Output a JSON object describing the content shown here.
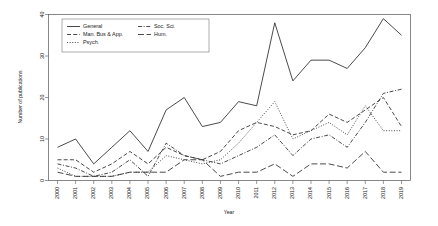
{
  "chart_data": {
    "type": "line",
    "title": "",
    "xlabel": "Year",
    "ylabel": "Number of publications",
    "x": [
      2000,
      2001,
      2002,
      2003,
      2004,
      2005,
      2006,
      2007,
      2008,
      2009,
      2010,
      2011,
      2012,
      2013,
      2014,
      2015,
      2016,
      2017,
      2018,
      2019
    ],
    "xtick_labels": [
      "2000",
      "2001",
      "2002",
      "2003",
      "2004",
      "2005",
      "2006",
      "2007",
      "2008",
      "2009",
      "2010",
      "2011",
      "2012",
      "2013",
      "2014",
      "2015",
      "2016",
      "2017",
      "2018",
      "2019"
    ],
    "ytick_labels": [
      "0",
      "10",
      "20",
      "30",
      "40"
    ],
    "yticks": [
      0,
      10,
      20,
      30,
      40
    ],
    "ylim": [
      0,
      40
    ],
    "xlim": [
      2000,
      2019
    ],
    "grid": false,
    "legend_position": "top-left-inside",
    "series": [
      {
        "name": "General",
        "dash": "solid",
        "values": [
          8,
          10,
          4,
          8,
          12,
          7,
          17,
          20,
          13,
          14,
          19,
          18,
          38,
          24,
          29,
          29,
          27,
          32,
          39,
          35
        ]
      },
      {
        "name": "Man. Bus & App.",
        "dash": "dashed",
        "values": [
          5,
          5,
          2,
          4,
          7,
          4,
          8,
          6,
          5,
          7,
          12,
          14,
          13,
          11,
          12,
          16,
          14,
          17,
          20,
          13
        ]
      },
      {
        "name": "Psych.",
        "dash": "dotted",
        "values": [
          3,
          1,
          1,
          1,
          2,
          2,
          6,
          5,
          4,
          5,
          9,
          14,
          19,
          10,
          12,
          14,
          11,
          18,
          12,
          12
        ]
      },
      {
        "name": "Soc. Sci.",
        "dash": "dashdot",
        "values": [
          4,
          3,
          1,
          2,
          5,
          1,
          9,
          6,
          5,
          4,
          6,
          8,
          11,
          6,
          10,
          11,
          8,
          14,
          21,
          22
        ]
      },
      {
        "name": "Hum.",
        "dash": "longdash",
        "values": [
          2,
          1,
          1,
          1,
          2,
          2,
          2,
          5,
          5,
          1,
          2,
          2,
          4,
          1,
          4,
          4,
          3,
          7,
          2,
          2
        ]
      }
    ]
  },
  "legend": {
    "entries": [
      {
        "label": "General",
        "column": 0,
        "row": 0
      },
      {
        "label": "Man. Bus & App.",
        "column": 0,
        "row": 1
      },
      {
        "label": "Psych.",
        "column": 0,
        "row": 2
      },
      {
        "label": "Soc. Sci.",
        "column": 1,
        "row": 0
      },
      {
        "label": "Hum.",
        "column": 1,
        "row": 1
      }
    ]
  },
  "colors": {
    "background": "#ffffff",
    "line": "#2b2b2b",
    "frame": "#555555",
    "text": "#1a1a1a"
  }
}
